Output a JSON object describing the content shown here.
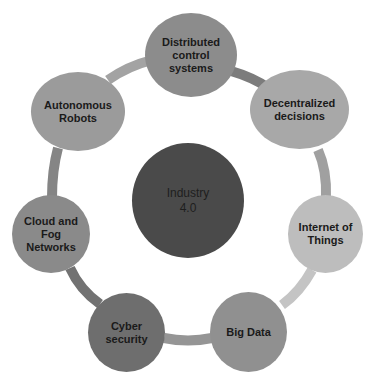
{
  "diagram": {
    "center": {
      "label": "Industry\n4.0",
      "color": "#4a4a4a"
    },
    "ring": {
      "stroke_width": 10
    },
    "nodes": [
      {
        "label": "Distributed\ncontrol\nsystems",
        "color": "#8c8c8c"
      },
      {
        "label": "Decentralized\ndecisions",
        "color": "#a8a8a8"
      },
      {
        "label": "Internet of\nThings",
        "color": "#bdbdbd"
      },
      {
        "label": "Big Data",
        "color": "#909090"
      },
      {
        "label": "Cyber\nsecurity",
        "color": "#6e6e6e"
      },
      {
        "label": "Cloud and\nFog\nNetworks",
        "color": "#8a8a8a"
      },
      {
        "label": "Autonomous\nRobots",
        "color": "#9b9b9b"
      }
    ],
    "ring_segments": [
      {
        "from": "Distributed control systems",
        "to": "Decentralized decisions",
        "color": "#7c7c7c"
      },
      {
        "from": "Decentralized decisions",
        "to": "Internet of Things",
        "color": "#a0a0a0"
      },
      {
        "from": "Internet of Things",
        "to": "Big Data",
        "color": "#c4c4c4"
      },
      {
        "from": "Big Data",
        "to": "Cyber security",
        "color": "#959595"
      },
      {
        "from": "Cyber security",
        "to": "Cloud and Fog Networks",
        "color": "#727272"
      },
      {
        "from": "Cloud and Fog Networks",
        "to": "Autonomous Robots",
        "color": "#858585"
      },
      {
        "from": "Autonomous Robots",
        "to": "Distributed control systems",
        "color": "#a3a3a3"
      }
    ]
  }
}
